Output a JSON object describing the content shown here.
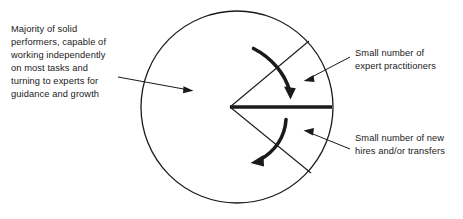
{
  "diagram": {
    "shape": "circle",
    "stroke_color": "#1a1a1a",
    "background_color": "#ffffff",
    "text_color": "#1a1a1a",
    "segments": [
      {
        "name": "majority-solid-performers",
        "label": "Majority of solid\nperformers, capable of\nworking independently\non most tasks and\nturning to experts for\nguidance and growth",
        "position": "left",
        "relative_size": "majority"
      },
      {
        "name": "expert-practitioners",
        "label": "Small number of\nexpert practitioners",
        "position": "upper-right-wedge",
        "relative_size": "small"
      },
      {
        "name": "new-hires-transfers",
        "label": "Small number of new\nhires and/or transfers",
        "position": "lower-right-wedge",
        "relative_size": "small"
      }
    ],
    "arrows": {
      "upper_curved_arrow": "curved arrow sweeping clockwise from upper-left down toward the thick dividing line",
      "lower_curved_arrow": "curved arrow sweeping counter-clockwise from the thick dividing line down to the lower-left"
    }
  }
}
